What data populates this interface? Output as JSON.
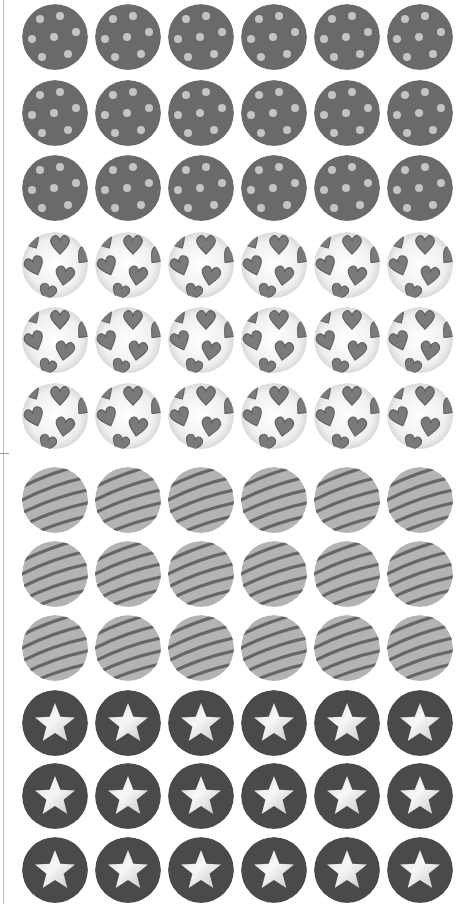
{
  "sheet": {
    "columns": 6,
    "rows": 12,
    "column_centers_x": [
      55,
      128,
      201,
      274,
      347,
      420
    ],
    "row_centers_y": [
      37,
      113,
      188,
      265,
      340,
      416,
      500,
      574,
      648,
      723,
      796,
      870
    ],
    "badge_diameter": 66,
    "groups": [
      {
        "pattern": "polka-dot",
        "rows": [
          0,
          1,
          2
        ],
        "base_color": "#6a6a6a",
        "accent_color": "#c4c4c4"
      },
      {
        "pattern": "hearts",
        "rows": [
          3,
          4,
          5
        ],
        "base_color": "#ececec",
        "accent_color": "#7a7a7a"
      },
      {
        "pattern": "stripes",
        "rows": [
          6,
          7,
          8
        ],
        "base_color": "#b3b3b3",
        "accent_color": "#666666"
      },
      {
        "pattern": "star",
        "rows": [
          9,
          10,
          11
        ],
        "base_color": "#4a4a4a",
        "accent_color": "#e6e6e6"
      }
    ]
  },
  "colors": {
    "background": "#ffffff",
    "edge_line": "#b9b9b9"
  }
}
